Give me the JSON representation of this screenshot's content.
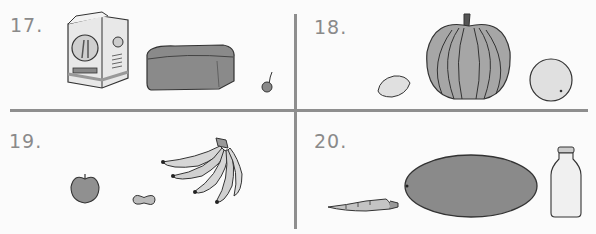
{
  "worksheet": {
    "panels": [
      {
        "number": "17.",
        "items": [
          "flour-bag",
          "bread-loaf",
          "cherry"
        ]
      },
      {
        "number": "18.",
        "items": [
          "lemon",
          "pumpkin",
          "orange"
        ]
      },
      {
        "number": "19.",
        "items": [
          "apple",
          "peanut",
          "banana-bunch"
        ]
      },
      {
        "number": "20.",
        "items": [
          "carrot",
          "watermelon",
          "milk-bottle"
        ]
      }
    ]
  },
  "colors": {
    "divider": "#8e8e8e",
    "label": "#8a8a8a",
    "outline": "#3a3a3a",
    "fill_dark": "#8c8c8c",
    "fill_mid": "#a8a8a8",
    "fill_light": "#dcdcdc"
  }
}
